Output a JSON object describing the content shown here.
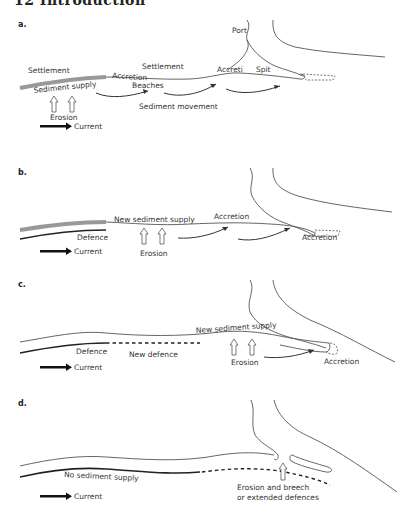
{
  "header": {
    "text": "12   Introduction"
  },
  "panels": [
    {
      "label": "a.",
      "texts": {
        "port": "Port",
        "settlement_left": "Settlement",
        "settlement_mid": "Settlement",
        "accretion_left": "Accretion",
        "accretion_right": "Accreti",
        "spit": "Spit",
        "sediment_supply": "Sediment  supply",
        "beaches": "Beaches",
        "sediment_movement": "Sediment movement",
        "erosion": "Erosion",
        "current": "Current"
      }
    },
    {
      "label": "b.",
      "texts": {
        "new_sediment_supply": "New  sediment  supply",
        "accretion_top": "Accretion",
        "defence": "Defence",
        "erosion": "Erosion",
        "accretion_right": "Accretion",
        "current": "Current"
      }
    },
    {
      "label": "c.",
      "texts": {
        "new_sediment_supply": "New  sediment  supply",
        "defence": "Defence",
        "new_defence": "New defence",
        "erosion": "Erosion",
        "accretion": "Accretion",
        "current": "Current"
      }
    },
    {
      "label": "d.",
      "texts": {
        "no_sediment_supply": "No  sediment  supply",
        "erosion_breech_1": "Erosion and breech",
        "erosion_breech_2": "or extended defences",
        "current": "Current"
      }
    }
  ],
  "icons": {
    "current_arrow": "thick-right-arrow",
    "erosion_arrow": "hollow-up-arrow",
    "movement_arrow": "curved-right-arrow"
  }
}
